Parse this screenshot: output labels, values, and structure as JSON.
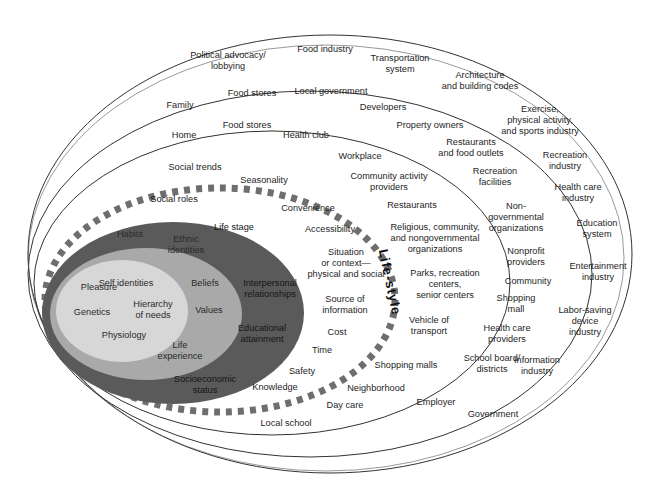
{
  "diagram": {
    "center_label": "Life-style",
    "colors": {
      "light_core": "#d7d7d7",
      "medium_ring": "#a9a9a9",
      "dark_ring": "#5a5a5a",
      "dash": "#6e6e6e",
      "outline": "#333333"
    },
    "core_individual": [
      {
        "text": "Self identities",
        "x": 126,
        "y": 283
      },
      {
        "text": "Pleasure",
        "x": 99,
        "y": 287
      },
      {
        "text": "Hierarchy\nof needs",
        "x": 153,
        "y": 310
      },
      {
        "text": "Genetics",
        "x": 92,
        "y": 312
      },
      {
        "text": "Physiology",
        "x": 124,
        "y": 335
      }
    ],
    "middle_ring": [
      {
        "text": "Habits",
        "x": 130,
        "y": 234
      },
      {
        "text": "Ethnic\nidentities",
        "x": 186,
        "y": 245
      },
      {
        "text": "Beliefs",
        "x": 205,
        "y": 283
      },
      {
        "text": "Values",
        "x": 209,
        "y": 310
      },
      {
        "text": "Life\nexperience",
        "x": 180,
        "y": 351
      }
    ],
    "dark_ring": [
      {
        "text": "Social roles",
        "x": 174,
        "y": 199
      },
      {
        "text": "Life stage",
        "x": 234,
        "y": 227
      },
      {
        "text": "Interpersonal\nrelationships",
        "x": 270,
        "y": 289
      },
      {
        "text": "Educational\nattainment",
        "x": 262,
        "y": 334
      },
      {
        "text": "Socioeconomic\nstatus",
        "x": 205,
        "y": 385
      }
    ],
    "lifestyle_ring": [
      {
        "text": "Social trends",
        "x": 195,
        "y": 167
      },
      {
        "text": "Seasonality",
        "x": 264,
        "y": 180
      },
      {
        "text": "Convenience",
        "x": 308,
        "y": 208
      },
      {
        "text": "Accessibility",
        "x": 330,
        "y": 229
      },
      {
        "text": "Situation\nor context—\nphysical and social",
        "x": 346,
        "y": 263
      },
      {
        "text": "Source of\ninformation",
        "x": 345,
        "y": 305
      },
      {
        "text": "Cost",
        "x": 337,
        "y": 332
      },
      {
        "text": "Time",
        "x": 322,
        "y": 350
      },
      {
        "text": "Safety",
        "x": 302,
        "y": 371
      },
      {
        "text": "Knowledge",
        "x": 275,
        "y": 387
      }
    ],
    "physical_setting": [
      {
        "text": "Home",
        "x": 184,
        "y": 135
      },
      {
        "text": "Food stores",
        "x": 247,
        "y": 125
      },
      {
        "text": "Health club",
        "x": 306,
        "y": 135
      },
      {
        "text": "Workplace",
        "x": 360,
        "y": 156
      },
      {
        "text": "Community activity\nproviders",
        "x": 389,
        "y": 182
      },
      {
        "text": "Restaurants",
        "x": 412,
        "y": 205
      },
      {
        "text": "Religious, community,\nand nongovernmental\norganizations",
        "x": 435,
        "y": 238
      },
      {
        "text": "Parks, recreation\ncenters,\nsenior centers",
        "x": 445,
        "y": 284
      },
      {
        "text": "Vehicle of\ntransport",
        "x": 429,
        "y": 326
      },
      {
        "text": "Shopping malls",
        "x": 406,
        "y": 365
      },
      {
        "text": "Neighborhood",
        "x": 376,
        "y": 388
      },
      {
        "text": "Day care",
        "x": 345,
        "y": 405
      },
      {
        "text": "Local school",
        "x": 286,
        "y": 423
      }
    ],
    "social_environment": [
      {
        "text": "Family",
        "x": 180,
        "y": 105
      },
      {
        "text": "Food stores",
        "x": 252,
        "y": 93
      },
      {
        "text": "Local government",
        "x": 331,
        "y": 91
      },
      {
        "text": "Developers",
        "x": 383,
        "y": 107
      },
      {
        "text": "Property owners",
        "x": 430,
        "y": 125
      },
      {
        "text": "Restaurants\nand food outlets",
        "x": 471,
        "y": 148
      },
      {
        "text": "Recreation\nfacilities",
        "x": 495,
        "y": 177
      },
      {
        "text": "Non-\ngovernmental\norganizations",
        "x": 516,
        "y": 217
      },
      {
        "text": "Nonprofit\nproviders",
        "x": 526,
        "y": 257
      },
      {
        "text": "Community",
        "x": 528,
        "y": 281
      },
      {
        "text": "Shopping\nmall",
        "x": 516,
        "y": 304
      },
      {
        "text": "Health care\nproviders",
        "x": 507,
        "y": 334
      },
      {
        "text": "School board/\ndistricts",
        "x": 492,
        "y": 364
      },
      {
        "text": "Employer",
        "x": 436,
        "y": 402
      }
    ],
    "macro_environment": [
      {
        "text": "Political advocacy/\nlobbying",
        "x": 228,
        "y": 61
      },
      {
        "text": "Food industry",
        "x": 325,
        "y": 49
      },
      {
        "text": "Transportation\nsystem",
        "x": 400,
        "y": 64
      },
      {
        "text": "Architecture\nand building codes",
        "x": 480,
        "y": 81
      },
      {
        "text": "Exercise,\nphysical activity,\nand sports industry",
        "x": 540,
        "y": 120
      },
      {
        "text": "Recreation\nindustry",
        "x": 565,
        "y": 161
      },
      {
        "text": "Health care\nindustry",
        "x": 578,
        "y": 193
      },
      {
        "text": "Education\nsystem",
        "x": 597,
        "y": 229
      },
      {
        "text": "Entertainment\nindustry",
        "x": 598,
        "y": 272
      },
      {
        "text": "Labor-saving\ndevice\nindustry",
        "x": 585,
        "y": 321
      },
      {
        "text": "Information\nindustry",
        "x": 537,
        "y": 366
      },
      {
        "text": "Government",
        "x": 493,
        "y": 414
      }
    ]
  }
}
